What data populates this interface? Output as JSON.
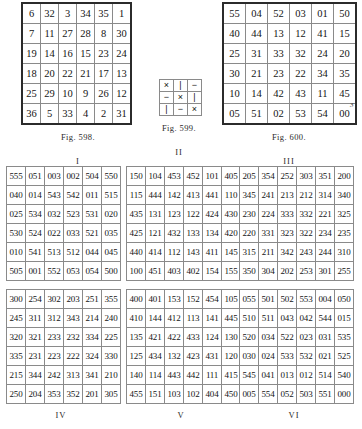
{
  "page": {
    "page_number": "3"
  },
  "figures": [
    {
      "id": "fig-598",
      "caption": "Fig. 598.",
      "roman": "I",
      "rows": [
        [
          "6",
          "32",
          "3",
          "34",
          "35",
          "1"
        ],
        [
          "7",
          "11",
          "27",
          "28",
          "8",
          "30"
        ],
        [
          "19",
          "14",
          "16",
          "15",
          "23",
          "24"
        ],
        [
          "18",
          "20",
          "22",
          "21",
          "17",
          "13"
        ],
        [
          "25",
          "29",
          "10",
          "9",
          "26",
          "12"
        ],
        [
          "36",
          "5",
          "33",
          "4",
          "2",
          "31"
        ]
      ]
    },
    {
      "id": "fig-599",
      "caption": "Fig. 599.",
      "roman": "II",
      "rows": [
        [
          "×",
          "|",
          "−"
        ],
        [
          "−",
          "×",
          "|"
        ],
        [
          "|",
          "−",
          "×"
        ]
      ]
    },
    {
      "id": "fig-600",
      "caption": "Fig. 600.",
      "roman": "III",
      "rows": [
        [
          "55",
          "04",
          "52",
          "03",
          "01",
          "50"
        ],
        [
          "40",
          "44",
          "13",
          "12",
          "41",
          "15"
        ],
        [
          "25",
          "31",
          "33",
          "32",
          "24",
          "20"
        ],
        [
          "30",
          "21",
          "23",
          "22",
          "34",
          "35"
        ],
        [
          "10",
          "14",
          "42",
          "43",
          "11",
          "45"
        ],
        [
          "05",
          "51",
          "02",
          "53",
          "54",
          "00"
        ]
      ]
    }
  ],
  "tables": [
    {
      "id": "table-I",
      "roman": "I",
      "rows": [
        [
          "555",
          "051",
          "003",
          "002",
          "504",
          "550"
        ],
        [
          "040",
          "014",
          "543",
          "542",
          "011",
          "515"
        ],
        [
          "025",
          "534",
          "032",
          "523",
          "531",
          "020"
        ],
        [
          "530",
          "524",
          "022",
          "033",
          "521",
          "035"
        ],
        [
          "010",
          "541",
          "513",
          "512",
          "044",
          "045"
        ],
        [
          "505",
          "001",
          "552",
          "053",
          "054",
          "500"
        ]
      ]
    },
    {
      "id": "table-II",
      "roman": "II",
      "rows": [
        [
          "150",
          "104",
          "453",
          "452",
          "101",
          "405"
        ],
        [
          "115",
          "444",
          "142",
          "413",
          "441",
          "110"
        ],
        [
          "435",
          "131",
          "123",
          "122",
          "424",
          "430"
        ],
        [
          "425",
          "121",
          "432",
          "133",
          "134",
          "420"
        ],
        [
          "440",
          "414",
          "112",
          "143",
          "411",
          "145"
        ],
        [
          "100",
          "451",
          "403",
          "402",
          "154",
          "155"
        ]
      ]
    },
    {
      "id": "table-III",
      "roman": "III",
      "rows": [
        [
          "205",
          "354",
          "252",
          "303",
          "351",
          "200"
        ],
        [
          "345",
          "241",
          "213",
          "212",
          "314",
          "340"
        ],
        [
          "230",
          "224",
          "333",
          "332",
          "221",
          "325"
        ],
        [
          "220",
          "331",
          "323",
          "322",
          "234",
          "235"
        ],
        [
          "315",
          "211",
          "342",
          "243",
          "244",
          "310"
        ],
        [
          "350",
          "304",
          "202",
          "253",
          "301",
          "255"
        ]
      ]
    },
    {
      "id": "table-IV",
      "roman": "IV",
      "rows": [
        [
          "300",
          "254",
          "302",
          "203",
          "251",
          "355"
        ],
        [
          "245",
          "311",
          "312",
          "343",
          "214",
          "240"
        ],
        [
          "320",
          "321",
          "233",
          "232",
          "334",
          "225"
        ],
        [
          "335",
          "231",
          "223",
          "222",
          "324",
          "330"
        ],
        [
          "215",
          "344",
          "242",
          "313",
          "341",
          "210"
        ],
        [
          "250",
          "204",
          "353",
          "352",
          "201",
          "305"
        ]
      ]
    },
    {
      "id": "table-V",
      "roman": "V",
      "rows": [
        [
          "400",
          "401",
          "153",
          "152",
          "454",
          "105"
        ],
        [
          "410",
          "144",
          "412",
          "113",
          "141",
          "445"
        ],
        [
          "135",
          "421",
          "422",
          "433",
          "124",
          "130"
        ],
        [
          "125",
          "434",
          "132",
          "423",
          "431",
          "120"
        ],
        [
          "140",
          "114",
          "443",
          "442",
          "111",
          "415"
        ],
        [
          "455",
          "151",
          "103",
          "102",
          "404",
          "450"
        ]
      ]
    },
    {
      "id": "table-VI",
      "roman": "VI",
      "rows": [
        [
          "055",
          "501",
          "502",
          "553",
          "004",
          "050"
        ],
        [
          "510",
          "511",
          "043",
          "042",
          "544",
          "015"
        ],
        [
          "520",
          "034",
          "522",
          "023",
          "031",
          "535"
        ],
        [
          "030",
          "024",
          "533",
          "532",
          "021",
          "525"
        ],
        [
          "545",
          "041",
          "013",
          "012",
          "514",
          "540"
        ],
        [
          "005",
          "554",
          "052",
          "503",
          "551",
          "000"
        ]
      ]
    }
  ]
}
